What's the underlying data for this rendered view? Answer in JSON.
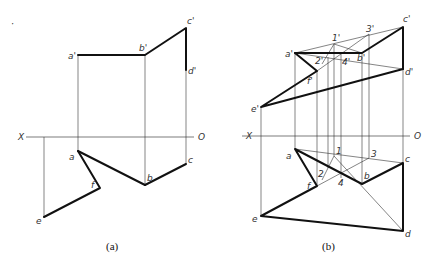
{
  "figure_a": {
    "caption": "(a)",
    "axis": {
      "left_label": "X",
      "right_label": "O"
    },
    "labels": {
      "a_prime": "a'",
      "b_prime": "b'",
      "c_prime": "c'",
      "d_prime": "d'",
      "a": "a",
      "b": "b",
      "c": "c",
      "e": "e",
      "f": "f"
    }
  },
  "figure_b": {
    "caption": "(b)",
    "axis": {
      "left_label": "X",
      "right_label": "O"
    },
    "labels": {
      "a_prime": "a'",
      "b_prime": "b'",
      "c_prime": "c'",
      "d_prime": "d'",
      "e_prime": "e'",
      "f_prime": "f'",
      "p1_prime": "1'",
      "p2_prime": "2'",
      "p3_prime": "3'",
      "p4_prime": "4'",
      "a": "a",
      "b": "b",
      "c": "c",
      "d": "d",
      "e": "e",
      "f": "f",
      "p1": "1",
      "p2": "2",
      "p3": "3",
      "p4": "4"
    }
  },
  "corner_mark": "·"
}
